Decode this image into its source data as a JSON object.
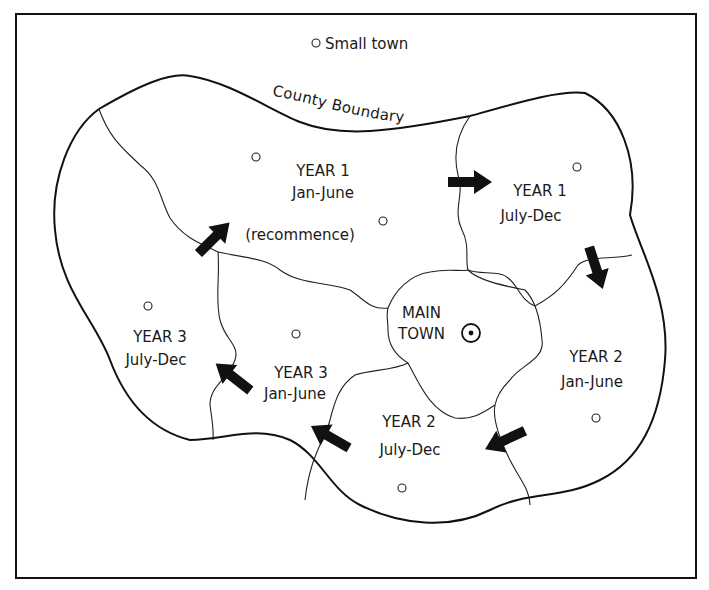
{
  "legend": {
    "small_town_label": "Small town",
    "small_town_icon": "hollow-circle"
  },
  "county_boundary_label": "County Boundary",
  "main_town": {
    "line1": "MAIN",
    "line2": "TOWN",
    "icon": "circled-dot"
  },
  "zones": [
    {
      "id": "y1-jan-june",
      "line1": "YEAR 1",
      "line2": "Jan-June",
      "line3": "(recommence)"
    },
    {
      "id": "y1-july-dec",
      "line1": "YEAR 1",
      "line2": "July-Dec"
    },
    {
      "id": "y2-jan-june",
      "line1": "YEAR 2",
      "line2": "Jan-June"
    },
    {
      "id": "y2-july-dec",
      "line1": "YEAR 2",
      "line2": "July-Dec"
    },
    {
      "id": "y3-jan-june",
      "line1": "YEAR 3",
      "line2": "Jan-June"
    },
    {
      "id": "y3-july-dec",
      "line1": "YEAR 3",
      "line2": "July-Dec"
    }
  ],
  "arrows": [
    {
      "from": "YEAR 1 Jan-June",
      "to": "YEAR 1 July-Dec",
      "direction": "right"
    },
    {
      "from": "YEAR 1 July-Dec",
      "to": "YEAR 2 Jan-June",
      "direction": "down"
    },
    {
      "from": "YEAR 2 Jan-June",
      "to": "YEAR 2 July-Dec",
      "direction": "down-left"
    },
    {
      "from": "YEAR 2 July-Dec",
      "to": "YEAR 3 Jan-June",
      "direction": "up-left"
    },
    {
      "from": "YEAR 3 Jan-June",
      "to": "YEAR 3 July-Dec",
      "direction": "up-left"
    },
    {
      "from": "YEAR 3 July-Dec",
      "to": "YEAR 1 Jan-June",
      "direction": "up-right"
    }
  ],
  "colors": {
    "line": "#111111",
    "background": "#ffffff"
  }
}
